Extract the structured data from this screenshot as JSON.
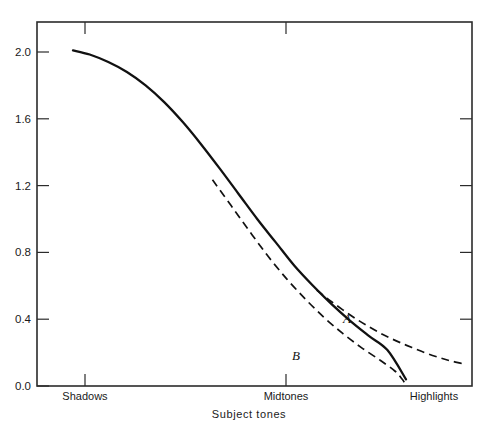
{
  "figure": {
    "background": "#ffffff",
    "ink_color": "#111111",
    "axis_color": "#2b2b2b"
  },
  "chart_data": {
    "type": "line",
    "title": "",
    "xlabel": "Subject tones",
    "ylabel": "",
    "grid": false,
    "legend": "inline-annotations",
    "xlim": [
      0,
      1
    ],
    "ylim": [
      0.0,
      2.2
    ],
    "y_ticks": [
      "0.0",
      "0.4",
      "0.8",
      "1.2",
      "1.6",
      "2.0"
    ],
    "y_tick_values": [
      0.0,
      0.4,
      0.8,
      1.2,
      1.6,
      2.0
    ],
    "x_ticks": [
      "Shadows",
      "Midtones",
      "Highlights"
    ],
    "x_tick_positions": [
      0.105,
      0.568,
      1.0
    ],
    "annotations": [
      {
        "text": "A",
        "x": 0.82,
        "y": 0.41
      },
      {
        "text": "B",
        "x": 0.6,
        "y": 0.22
      }
    ],
    "series": [
      {
        "name": "main",
        "style": "solid",
        "points": [
          [
            0.105,
            2.01
          ],
          [
            0.15,
            1.985
          ],
          [
            0.2,
            1.94
          ],
          [
            0.25,
            1.88
          ],
          [
            0.3,
            1.8
          ],
          [
            0.35,
            1.7
          ],
          [
            0.4,
            1.58
          ],
          [
            0.45,
            1.445
          ],
          [
            0.5,
            1.3
          ],
          [
            0.55,
            1.15
          ],
          [
            0.6,
            1.0
          ],
          [
            0.65,
            0.86
          ],
          [
            0.7,
            0.72
          ],
          [
            0.75,
            0.6
          ],
          [
            0.8,
            0.49
          ],
          [
            0.85,
            0.39
          ],
          [
            0.9,
            0.3
          ],
          [
            0.95,
            0.215
          ],
          [
            1.0,
            0.04
          ]
        ]
      },
      {
        "name": "A",
        "style": "dashed",
        "points": [
          [
            0.76,
            0.575
          ],
          [
            0.8,
            0.505
          ],
          [
            0.85,
            0.425
          ],
          [
            0.9,
            0.355
          ],
          [
            0.95,
            0.295
          ],
          [
            1.0,
            0.245
          ],
          [
            1.05,
            0.2
          ],
          [
            1.09,
            0.17
          ],
          [
            1.12,
            0.15
          ],
          [
            1.15,
            0.135
          ]
        ]
      },
      {
        "name": "B",
        "style": "dashed",
        "points": [
          [
            0.48,
            1.235
          ],
          [
            0.53,
            1.08
          ],
          [
            0.58,
            0.925
          ],
          [
            0.63,
            0.775
          ],
          [
            0.68,
            0.64
          ],
          [
            0.73,
            0.52
          ],
          [
            0.78,
            0.41
          ],
          [
            0.83,
            0.315
          ],
          [
            0.88,
            0.23
          ],
          [
            0.93,
            0.155
          ],
          [
            0.97,
            0.09
          ],
          [
            0.99,
            0.04
          ],
          [
            1.0,
            0.005
          ]
        ]
      }
    ]
  }
}
